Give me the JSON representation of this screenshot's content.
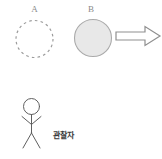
{
  "diagram": {
    "label_a": "A",
    "label_b": "B",
    "observer_label": "관찰자",
    "colors": {
      "background": "#ffffff",
      "dashed_circle_stroke": "#9c9c9c",
      "filled_circle_fill": "#e8e8e8",
      "filled_circle_stroke": "#aaaaaa",
      "arrow_fill": "#ffffff",
      "arrow_stroke": "#8f8f8f",
      "figure_stroke": "#5f5f5f",
      "shape_label_color": "#8a8a8a",
      "observer_text_color": "#3a3a3a"
    }
  }
}
